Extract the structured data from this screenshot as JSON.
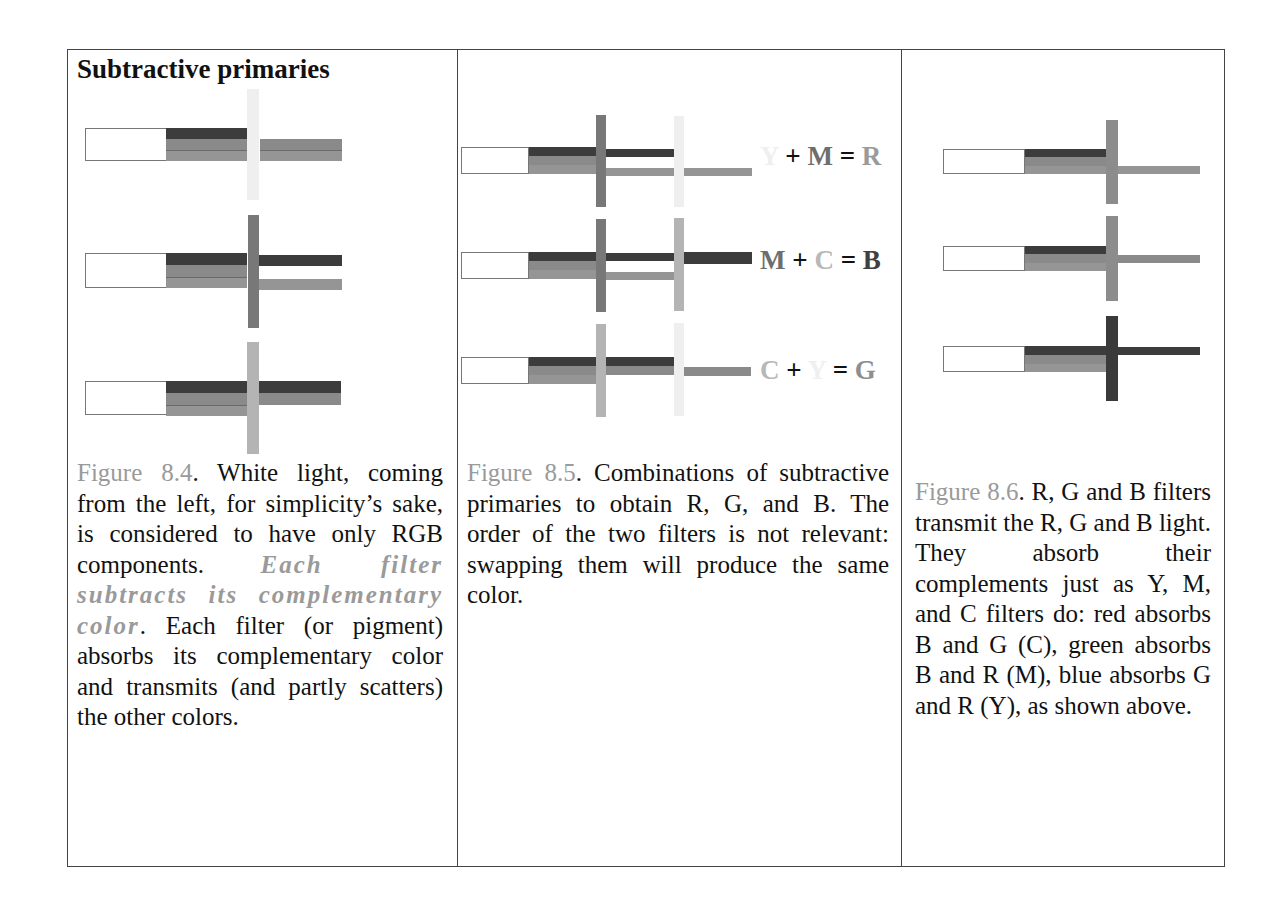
{
  "title": "Subtractive primaries",
  "colors": {
    "frame": "#444444",
    "figure_label": "#9a9a9a",
    "blue_band": "#3c3c3c",
    "green_band": "#8a8a8a",
    "red_band": "#959595",
    "yellow_filter": "#efefef",
    "magenta_filter": "#787878",
    "cyan_filter": "#b4b4b4"
  },
  "figures": [
    {
      "id": "8.4",
      "rows": [
        {
          "filter": "yellow",
          "transmitted": [
            "G",
            "R"
          ]
        },
        {
          "filter": "magenta",
          "transmitted": [
            "B",
            "R"
          ]
        },
        {
          "filter": "cyan",
          "transmitted": [
            "B",
            "G"
          ]
        }
      ],
      "caption": {
        "label": "Figure 8.4",
        "text_1": ". White light, coming from the left, for simplicity’s sake, is considered to have only RGB components. ",
        "emphasis": "Each filter subtracts its complementary color",
        "text_2": ". Each filter (or pigment) absorbs its complementary color and transmits (and partly scatters) the other colors."
      }
    },
    {
      "id": "8.5",
      "equations": [
        {
          "a": "Y",
          "op1": "+",
          "b": "M",
          "op2": "=",
          "result": "R"
        },
        {
          "a": "M",
          "op1": "+",
          "b": "C",
          "op2": "=",
          "result": "B"
        },
        {
          "a": "C",
          "op1": "+",
          "b": "Y",
          "op2": "=",
          "result": "G"
        }
      ],
      "caption": {
        "label": "Figure 8.5",
        "text": ". Combinations of subtractive primaries to obtain R, G, and B. The order of the two filters is not relevant: swapping them will produce the same color."
      }
    },
    {
      "id": "8.6",
      "rows": [
        {
          "filter": "red",
          "transmitted": [
            "R"
          ]
        },
        {
          "filter": "green",
          "transmitted": [
            "G"
          ]
        },
        {
          "filter": "blue",
          "transmitted": [
            "B"
          ]
        }
      ],
      "caption": {
        "label": "Figure 8.6",
        "text": ". R, G and B filters transmit the R, G and B light. They absorb their complements just as Y, M, and C filters do: red absorbs B and G (C), green absorbs B and R (M), blue absorbs G and R (Y), as shown above."
      }
    }
  ]
}
